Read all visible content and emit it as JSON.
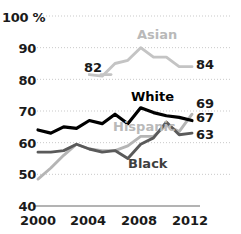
{
  "chart_data": {
    "type": "line",
    "title": "",
    "xlabel": "",
    "ylabel": "",
    "ylim": [
      40,
      100
    ],
    "xlim": [
      2000,
      2012
    ],
    "grid": true,
    "grid_style": "dotted-horizontal",
    "legend": "inline-series-labels",
    "y_ticks": [
      "100 %",
      "90",
      "80",
      "70",
      "60",
      "50",
      "40"
    ],
    "y_tick_values": [
      100,
      90,
      80,
      70,
      60,
      50,
      40
    ],
    "x_ticks": [
      "2000",
      "2004",
      "2008",
      "2012"
    ],
    "x_tick_values": [
      2000,
      2004,
      2008,
      2012
    ],
    "x": [
      2000,
      2001,
      2002,
      2003,
      2004,
      2005,
      2006,
      2007,
      2008,
      2009,
      2010,
      2011,
      2012
    ],
    "series": [
      {
        "name": "Asian",
        "color": "#c4c4c4",
        "start_label": "82",
        "end_label": "84",
        "x": [
          2004,
          2005,
          2006,
          2007,
          2008,
          2009,
          2010,
          2011,
          2012
        ],
        "values": [
          81.5,
          81,
          85,
          86,
          90,
          87,
          87,
          84,
          84
        ]
      },
      {
        "name": "White",
        "color": "#000000",
        "end_label": "67",
        "x": [
          2000,
          2001,
          2002,
          2003,
          2004,
          2005,
          2006,
          2007,
          2008,
          2009,
          2010,
          2011,
          2012
        ],
        "values": [
          64,
          63,
          65,
          64.5,
          67,
          66,
          69,
          66,
          71,
          69.5,
          68.5,
          68,
          67
        ]
      },
      {
        "name": "Hispanic",
        "color": "#b5b5b5",
        "end_label": "69",
        "x": [
          2000,
          2001,
          2002,
          2003,
          2004,
          2005,
          2006,
          2007,
          2008,
          2009,
          2010,
          2011,
          2012
        ],
        "values": [
          48.5,
          52,
          56,
          59.5,
          58,
          57.5,
          57.5,
          59,
          62,
          62,
          65.5,
          63.5,
          69
        ]
      },
      {
        "name": "Black",
        "color": "#5a5a5a",
        "end_label": "63",
        "x": [
          2000,
          2001,
          2002,
          2003,
          2004,
          2005,
          2006,
          2007,
          2008,
          2009,
          2010,
          2011,
          2012
        ],
        "values": [
          57,
          57,
          57.5,
          59.5,
          58,
          57,
          57.5,
          55,
          59.5,
          61.5,
          66.5,
          62.5,
          63
        ]
      }
    ],
    "series_label_positions": [
      {
        "name": "Asian",
        "x": 137,
        "y": 27
      },
      {
        "name": "White",
        "x": 131,
        "y": 89
      },
      {
        "name": "Hispanic",
        "x": 113,
        "y": 119
      },
      {
        "name": "Black",
        "x": 128,
        "y": 156
      }
    ],
    "annotations": [
      {
        "text": "82",
        "x": 84,
        "y": 60
      },
      {
        "text": "84",
        "x": 196,
        "y": 57
      },
      {
        "text": "69",
        "x": 196,
        "y": 96
      },
      {
        "text": "67",
        "x": 196,
        "y": 110
      },
      {
        "text": "63",
        "x": 196,
        "y": 127
      }
    ],
    "y_tick_positions": [
      {
        "label": "100 %",
        "x": 2,
        "y": 10
      },
      {
        "label": "90",
        "x": 2,
        "y": 41
      },
      {
        "label": "80",
        "x": 2,
        "y": 73
      },
      {
        "label": "70",
        "x": 2,
        "y": 104
      },
      {
        "label": "60",
        "x": 2,
        "y": 136
      },
      {
        "label": "50",
        "x": 2,
        "y": 167
      },
      {
        "label": "40",
        "x": 2,
        "y": 199
      }
    ],
    "x_tick_positions": [
      {
        "label": "2000",
        "x": 14,
        "y": 213
      },
      {
        "label": "2004",
        "x": 64,
        "y": 213
      },
      {
        "label": "2008",
        "x": 115,
        "y": 213
      },
      {
        "label": "2012",
        "x": 166,
        "y": 213
      }
    ]
  }
}
